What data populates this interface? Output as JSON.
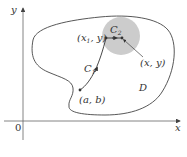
{
  "figure": {
    "axes": {
      "x_label": "x",
      "y_label": "y",
      "origin_label": "0"
    },
    "region_label": "D",
    "curves": {
      "c1": {
        "label": "C",
        "subscript": "1"
      },
      "c2": {
        "label": "C",
        "subscript": "2"
      }
    },
    "points": {
      "start": {
        "label": "(a, b)"
      },
      "x1y": {
        "label_open": "(x",
        "label_sub": "1",
        "label_close": ", y)"
      },
      "xy": {
        "label": "(x, y)"
      }
    },
    "colors": {
      "axis": "#555555",
      "curve": "#333333",
      "disk_fill": "#cccccc",
      "text": "#333333"
    }
  }
}
